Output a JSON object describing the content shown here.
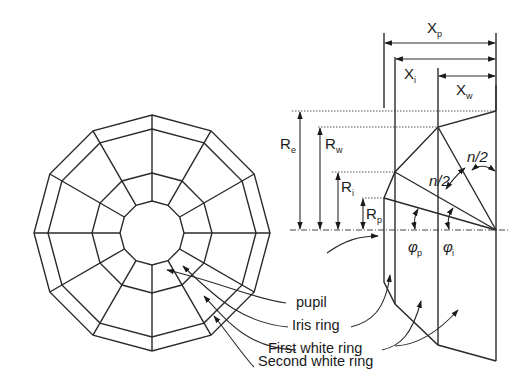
{
  "figure": {
    "left_view": {
      "description": "12-sided polygonal eye mesh viewed front-on",
      "sides": 12,
      "rings": [
        "pupil",
        "Iris ring",
        "First white ring",
        "Second white ring"
      ]
    },
    "labels": {
      "pupil": "pupil",
      "iris_ring": "Iris ring",
      "first_white_ring": "First white ring",
      "second_white_ring": "Second white ring"
    },
    "dimensions": {
      "Xp": {
        "main": "X",
        "sub": "p"
      },
      "Xi": {
        "main": "X",
        "sub": "i"
      },
      "Xw": {
        "main": "X",
        "sub": "w"
      },
      "Re": {
        "main": "R",
        "sub": "e"
      },
      "Rw": {
        "main": "R",
        "sub": "w"
      },
      "Ri": {
        "main": "R",
        "sub": "i"
      },
      "Rp": {
        "main": "R",
        "sub": "p"
      }
    },
    "angles": {
      "phi_p": {
        "main": "φ",
        "sub": "p"
      },
      "phi_i": {
        "main": "φ",
        "sub": "i"
      },
      "half_1": "n/2",
      "half_2": "n/2"
    },
    "colors": {
      "line": "#2a2a2a",
      "background": "#ffffff"
    }
  }
}
